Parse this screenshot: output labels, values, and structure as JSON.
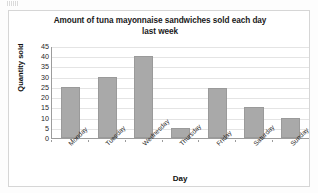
{
  "chart_data": {
    "type": "bar",
    "title": "Amount of tuna mayonnaise sandwiches sold each day last week",
    "title_line1": "Amount of tuna mayonnaise sandwiches sold each day",
    "title_line2": "last week",
    "xlabel": "Day",
    "ylabel": "Quantity sold",
    "categories": [
      "Monday",
      "Tuesday",
      "Wednesday",
      "Thursday",
      "Friday",
      "Saturday",
      "Sunday"
    ],
    "values": [
      25,
      30,
      40,
      5,
      24.5,
      15,
      10
    ],
    "ylim": [
      0,
      45
    ],
    "ytick_step": 5,
    "yticks": [
      45,
      40,
      35,
      30,
      25,
      20,
      15,
      10,
      5,
      0
    ],
    "ytick_labels": [
      "45",
      "40",
      "35",
      "30",
      "25",
      "20",
      "15",
      "10",
      "5",
      "0"
    ],
    "grid": "horizontal",
    "legend": "none",
    "bar_color": "#a9a9a9",
    "gridline_color": "#e4e4e4",
    "axis_color": "#9c9c9c",
    "plot_background": "#ffffff"
  },
  "x_labels": [
    {
      "label": "Monday"
    },
    {
      "label": "Tuesday"
    },
    {
      "label": "Wednesday"
    },
    {
      "label": "Thursday"
    },
    {
      "label": "Friday"
    },
    {
      "label": "Saturday"
    },
    {
      "label": "Sunday"
    }
  ]
}
